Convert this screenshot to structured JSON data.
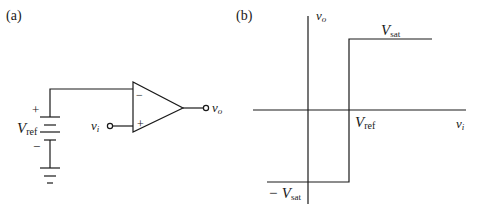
{
  "panel_a": {
    "label": "(a)",
    "vref_label": "V",
    "vref_sub": "ref",
    "plus_sign": "+",
    "minus_sign": "−",
    "opamp_inv": "−",
    "opamp_noninv": "+",
    "input_label": "v",
    "input_sub": "i",
    "output_label": "v",
    "output_sub": "o"
  },
  "panel_b": {
    "label": "(b)",
    "y_axis_label": "v",
    "y_axis_sub": "o",
    "x_axis_label": "v",
    "x_axis_sub": "i",
    "vsat_label": "V",
    "vsat_sub": "sat",
    "neg_vsat_prefix": "− V",
    "neg_vsat_sub": "sat",
    "vref_label": "V",
    "vref_sub": "ref"
  },
  "colors": {
    "stroke": "#1a1a1a",
    "background": "#ffffff"
  }
}
